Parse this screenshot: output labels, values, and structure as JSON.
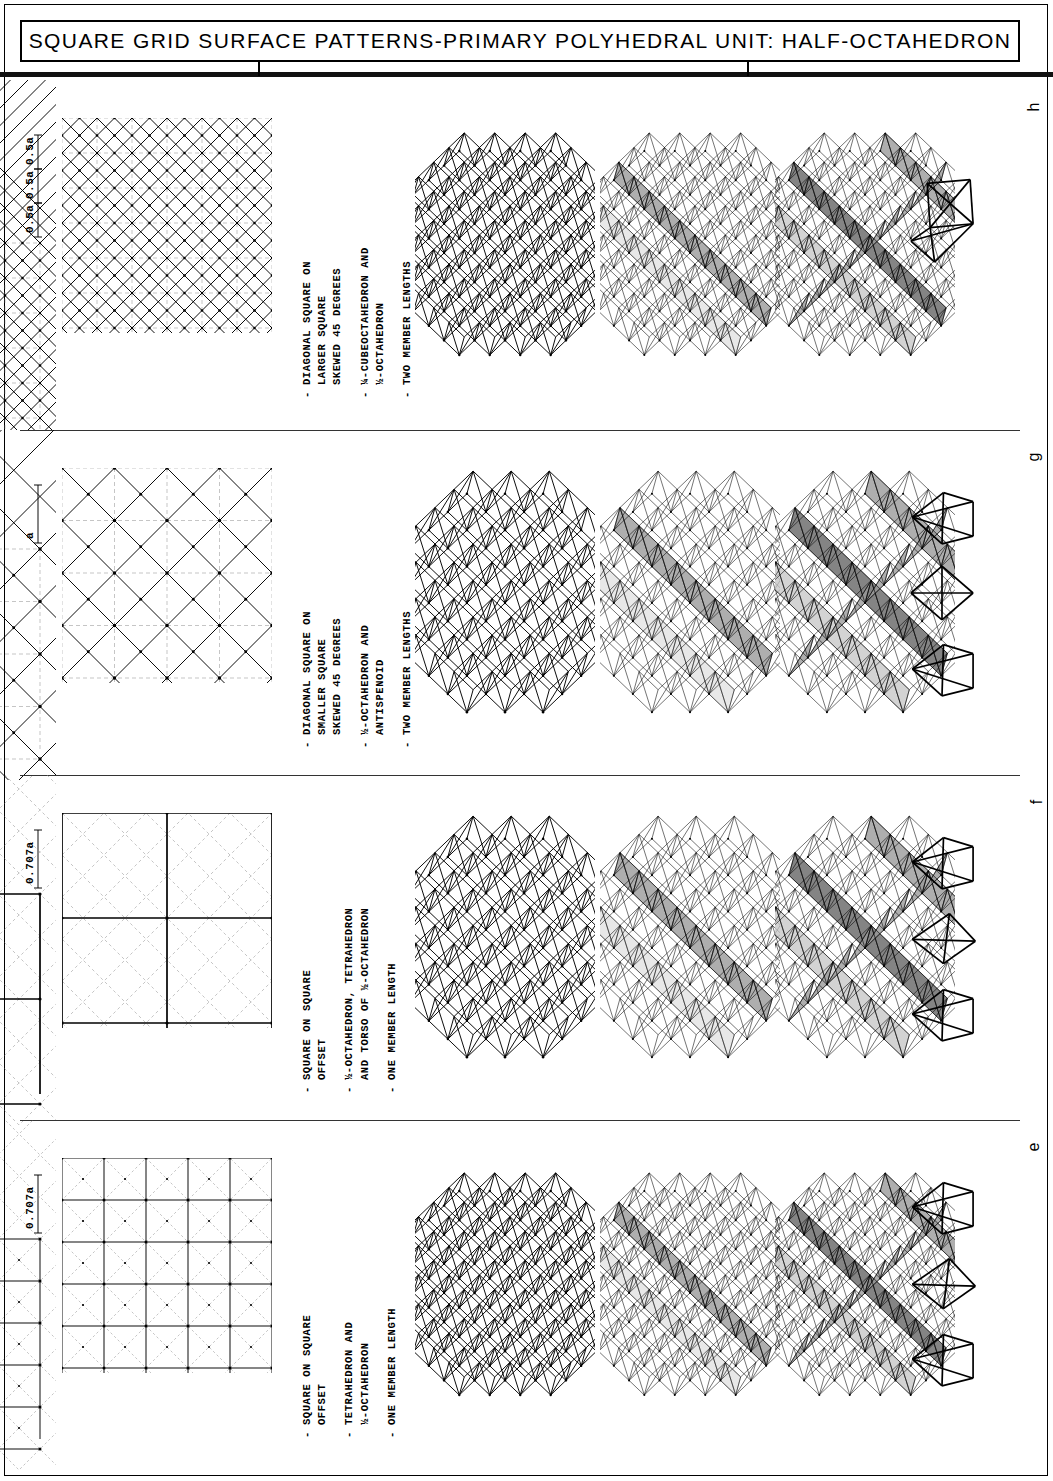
{
  "sheet": {
    "title": "SQUARE GRID SURFACE PATTERNS-PRIMARY POLYHEDRAL UNIT: HALF-OCTAHEDRON",
    "frame_color": "#000000",
    "background": "#ffffff"
  },
  "columns": [
    {
      "letter": "h",
      "dimension_labels": [
        "0.5a",
        "0.5a",
        "0.5a"
      ],
      "specs": [
        {
          "dash": "-",
          "text": "DIAGONAL SQUARE ON\nLARGER SQUARE\nSKEWED 45 DEGREES"
        },
        {
          "dash": "-",
          "text": "¼-CUBEOCTAHEDRON AND\n½-OCTAHEDRON"
        },
        {
          "dash": "-",
          "text": "TWO MEMBER LENGTHS"
        }
      ],
      "pattern": {
        "type": "diagonal-square-on-larger-square",
        "grid_divisions": 6,
        "diamond_scale": 0.5,
        "solid_line_weight": 1.1,
        "dashed_line_weight": 0.5
      },
      "figures": [
        {
          "name": "wireframe-truss",
          "style": "wireframe"
        },
        {
          "name": "shaded-truss-partial",
          "style": "shaded-light"
        },
        {
          "name": "shaded-truss-full",
          "style": "shaded-dark"
        },
        {
          "name": "polyhedral-units",
          "count": 1
        }
      ]
    },
    {
      "letter": "g",
      "dimension_labels": [
        "a"
      ],
      "specs": [
        {
          "dash": "-",
          "text": "DIAGONAL SQUARE ON\nSMALLER SQUARE\nSKEWED 45 DEGREES"
        },
        {
          "dash": "-",
          "text": "½-OCTAHEDRON AND\nANTISPENOID"
        },
        {
          "dash": "-",
          "text": "TWO MEMBER LENGTHS"
        }
      ],
      "pattern": {
        "type": "diagonal-square-on-smaller-square",
        "grid_divisions": 4,
        "diamond_scale": 1.0,
        "solid_line_weight": 1.3,
        "dashed_line_weight": 0.5
      },
      "figures": [
        {
          "name": "wireframe-truss",
          "style": "wireframe"
        },
        {
          "name": "shaded-truss-partial",
          "style": "shaded-light"
        },
        {
          "name": "shaded-truss-full",
          "style": "shaded-dark"
        },
        {
          "name": "polyhedral-units",
          "count": 3
        }
      ]
    },
    {
      "letter": "f",
      "dimension_labels": [
        "0.707a"
      ],
      "specs": [
        {
          "dash": "-",
          "text": "SQUARE ON SQUARE\nOFFSET"
        },
        {
          "dash": "-",
          "text": "½-OCTAHEDRON, TETRAHEDRON\nAND TORSO OF ½-OCTAHEDRON"
        },
        {
          "dash": "-",
          "text": "ONE MEMBER LENGTH"
        }
      ],
      "pattern": {
        "type": "square-on-square-offset",
        "grid_divisions": 2,
        "diamond_scale": 0.5,
        "solid_line_weight": 1.3,
        "dashed_line_weight": 0.6
      },
      "figures": [
        {
          "name": "wireframe-truss",
          "style": "wireframe"
        },
        {
          "name": "shaded-truss-partial",
          "style": "shaded-light"
        },
        {
          "name": "shaded-truss-full",
          "style": "shaded-dark"
        },
        {
          "name": "polyhedral-units",
          "count": 3
        }
      ]
    },
    {
      "letter": "e",
      "dimension_labels": [
        "0.707a"
      ],
      "specs": [
        {
          "dash": "-",
          "text": "SQUARE ON SQUARE\nOFFSET"
        },
        {
          "dash": "-",
          "text": "TETRAHEDRON AND\n½-OCTAHEDRON"
        },
        {
          "dash": "-",
          "text": "ONE MEMBER LENGTH"
        }
      ],
      "pattern": {
        "type": "square-on-square-offset-fine",
        "grid_divisions": 5,
        "diamond_scale": 0.5,
        "solid_line_weight": 1.0,
        "dashed_line_weight": 0.5
      },
      "figures": [
        {
          "name": "wireframe-truss",
          "style": "wireframe"
        },
        {
          "name": "shaded-truss-partial",
          "style": "shaded-light"
        },
        {
          "name": "shaded-truss-full",
          "style": "shaded-dark"
        },
        {
          "name": "polyhedral-units",
          "count": 3
        }
      ]
    }
  ]
}
